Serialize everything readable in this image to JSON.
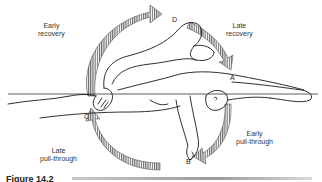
{
  "figure": {
    "caption": "Figure 14.2",
    "phases": [
      {
        "id": "early-recovery",
        "line1": "Early",
        "line2": "recovery"
      },
      {
        "id": "late-recovery",
        "line1": "Late",
        "line2": "recovery"
      },
      {
        "id": "early-pull-through",
        "line1": "Early",
        "line2": "pull-through"
      },
      {
        "id": "late-pull-through",
        "line1": "Late",
        "line2": "pull-through"
      }
    ],
    "points": {
      "a": "A",
      "b": "B",
      "c": "C",
      "d": "D"
    },
    "colors": {
      "line": "#1a1a1a",
      "hatch": "#555555",
      "background": "#ffffff"
    }
  }
}
